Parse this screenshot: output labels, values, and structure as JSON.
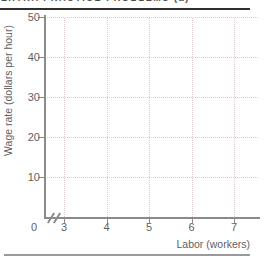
{
  "page": {
    "top_caption": "EXTRA PRACTICE PROBLEMS (a)"
  },
  "chart_data": {
    "type": "line",
    "title": "",
    "xlabel": "Labor (workers)",
    "ylabel": "Wage rate (dollars per hour)",
    "x_ticks": [
      3,
      4,
      5,
      6,
      7
    ],
    "y_ticks": [
      10,
      20,
      30,
      40,
      50
    ],
    "origin_label": "0",
    "xlim": [
      3,
      7
    ],
    "ylim": [
      0,
      50
    ],
    "x_axis_break": true,
    "grid": "dotted",
    "legend": "none",
    "series": []
  },
  "colors": {
    "axis": "#8a8a8a",
    "grid": "#d9cccc",
    "label": "#5f5f5f",
    "top_rule": "#2f2f2f",
    "bottom_rule": "#9a9a9a"
  }
}
